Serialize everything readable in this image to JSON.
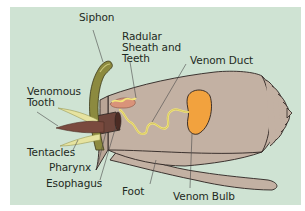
{
  "diagram": {
    "background_color": "#cfe3d3",
    "colors": {
      "shell": "#c3b1a3",
      "shell_outline": "#2b2320",
      "venom_bulb": "#f2a23e",
      "venom_duct": "#f3e67a",
      "siphon": "#8c8a3f",
      "venomous_tooth": "#7a4a3e",
      "tentacles": "#e6e3a0",
      "esophagus": "#6e463c"
    },
    "labels": {
      "siphon": "Siphon",
      "radular_sheath": "Radular\nSheath and\nTeeth",
      "venom_duct": "Venom Duct",
      "venomous_tooth": "Venomous\nTooth",
      "tentacles": "Tentacles",
      "pharynx": "Pharynx",
      "esophagus": "Esophagus",
      "foot": "Foot",
      "venom_bulb": "Venom Bulb"
    }
  }
}
